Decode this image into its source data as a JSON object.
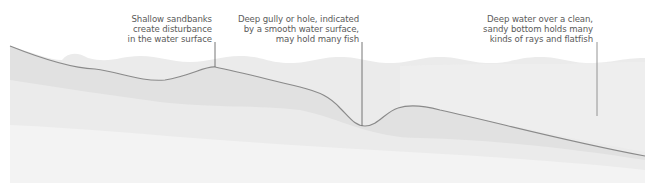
{
  "diagram": {
    "colors": {
      "background": "#ffffff",
      "water_layer": "#e9e9e9",
      "sand_layer_1": "#e2e2e2",
      "sand_layer_2": "#ececec",
      "sand_layer_3": "#f3f3f3",
      "seabed_line": "#8a8a8a",
      "callout_line": "#666666",
      "text": "#5a5a5a"
    },
    "callouts": [
      {
        "id": "shallow-sandbanks",
        "lines": [
          "Shallow sandbanks",
          "create disturbance",
          "in the water surface"
        ]
      },
      {
        "id": "deep-gully",
        "lines": [
          "Deep gully or hole, indicated",
          "by a smooth water surface,",
          "may hold many fish"
        ]
      },
      {
        "id": "deep-water",
        "lines": [
          "Deep water over a clean,",
          "sandy bottom holds many",
          "kinds of rays and flatfish"
        ]
      }
    ]
  }
}
